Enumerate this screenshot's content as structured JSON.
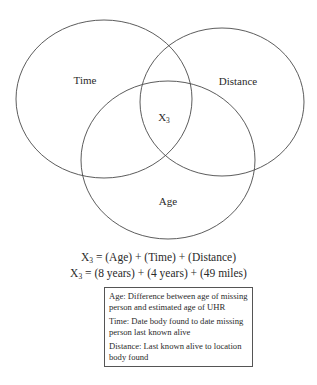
{
  "diagram": {
    "type": "venn",
    "sets": [
      {
        "id": "time",
        "label": "Time"
      },
      {
        "id": "distance",
        "label": "Distance"
      },
      {
        "id": "age",
        "label": "Age"
      }
    ],
    "intersection_label": {
      "base": "X",
      "subscript": "3"
    },
    "stroke_color": "#4a4a4a"
  },
  "equations": [
    {
      "lhs_base": "X",
      "lhs_sub": "3",
      "rhs": "= (Age) + (Time) + (Distance)"
    },
    {
      "lhs_base": "X",
      "lhs_sub": "3",
      "rhs": "= (8 years) + (4 years) + (49 miles)"
    }
  ],
  "legend": [
    {
      "text": "Age: Difference between age of missing person and estimated age of UHR"
    },
    {
      "text": "Time: Date body found to date missing person last known alive"
    },
    {
      "text": "Distance: Last known alive to location body found"
    }
  ]
}
